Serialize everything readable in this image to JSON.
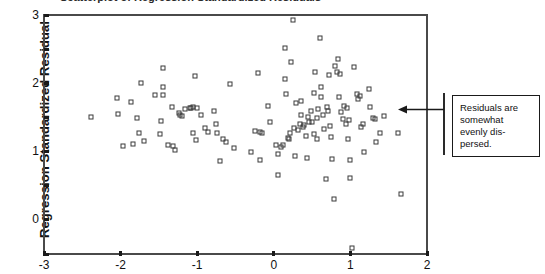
{
  "chart_data": {
    "type": "scatter",
    "title": "Scatterplot of Regression Standardized Residuals",
    "xlabel": "",
    "ylabel": "Regression Standardized Residual",
    "xlim": [
      -3,
      2
    ],
    "ylim": [
      -4,
      3
    ],
    "xticks": [
      -3,
      -2,
      -1,
      0,
      1,
      2
    ],
    "xticklabels": [
      "-3",
      "-2",
      "-1",
      "0",
      "1",
      "2"
    ],
    "yticks": [
      3,
      2,
      1,
      0,
      -1,
      -2,
      -3,
      -4
    ],
    "yticklabels": [
      "3",
      "2",
      "1",
      "0",
      "-1",
      "-2",
      "-3",
      "-4"
    ],
    "grid": false,
    "legend": null,
    "marker": "open-square",
    "marker_color": "#3a3a3a",
    "points": [
      [
        -2.38,
        0.02
      ],
      [
        -2.03,
        0.11
      ],
      [
        -2.05,
        0.57
      ],
      [
        -1.97,
        -0.85
      ],
      [
        -1.86,
        0.44
      ],
      [
        -1.84,
        -0.79
      ],
      [
        -1.74,
        1.0
      ],
      [
        -1.78,
        -0.02
      ],
      [
        -1.76,
        -0.46
      ],
      [
        -1.7,
        -0.7
      ],
      [
        -1.55,
        0.66
      ],
      [
        -1.45,
        1.45
      ],
      [
        -1.44,
        0.89
      ],
      [
        -1.45,
        0.66
      ],
      [
        -1.47,
        -0.1
      ],
      [
        -1.48,
        -0.49
      ],
      [
        -1.38,
        -0.81
      ],
      [
        -1.33,
        0.32
      ],
      [
        -1.31,
        -0.83
      ],
      [
        -1.29,
        -0.95
      ],
      [
        -1.24,
        0.12
      ],
      [
        -1.22,
        0.08
      ],
      [
        -1.2,
        0.04
      ],
      [
        -1.16,
        0.24
      ],
      [
        -1.1,
        0.27
      ],
      [
        -1.08,
        0.29
      ],
      [
        -1.03,
        1.22
      ],
      [
        -1.05,
        0.3
      ],
      [
        -1.05,
        -0.45
      ],
      [
        -1.0,
        0.28
      ],
      [
        -1.02,
        -0.65
      ],
      [
        -0.95,
        0.06
      ],
      [
        -0.9,
        -0.3
      ],
      [
        -0.86,
        -0.42
      ],
      [
        -0.78,
        0.19
      ],
      [
        -0.76,
        -0.2
      ],
      [
        -0.74,
        -0.45
      ],
      [
        -0.7,
        -1.29
      ],
      [
        -0.66,
        -0.62
      ],
      [
        -0.62,
        -0.73
      ],
      [
        -0.57,
        0.97
      ],
      [
        -0.52,
        -0.9
      ],
      [
        -0.3,
        -1.02
      ],
      [
        -0.24,
        -0.41
      ],
      [
        -0.21,
        1.31
      ],
      [
        -0.18,
        -0.44
      ],
      [
        -0.16,
        -0.46
      ],
      [
        -0.18,
        -1.24
      ],
      [
        -0.07,
        0.33
      ],
      [
        -0.05,
        -0.12
      ],
      [
        0.03,
        -0.8
      ],
      [
        0.05,
        -1.08
      ],
      [
        0.06,
        -1.69
      ],
      [
        0.09,
        -0.86
      ],
      [
        0.12,
        -0.82
      ],
      [
        0.15,
        2.03
      ],
      [
        0.14,
        1.12
      ],
      [
        0.16,
        0.7
      ],
      [
        0.18,
        -0.59
      ],
      [
        0.2,
        -0.64
      ],
      [
        0.21,
        -0.46
      ],
      [
        0.23,
        1.61
      ],
      [
        0.25,
        2.84
      ],
      [
        0.26,
        -0.3
      ],
      [
        0.28,
        -1.12
      ],
      [
        0.29,
        0.42
      ],
      [
        0.32,
        -0.38
      ],
      [
        0.34,
        -0.19
      ],
      [
        0.36,
        0.06
      ],
      [
        0.38,
        -0.28
      ],
      [
        0.35,
        0.47
      ],
      [
        0.4,
        -0.22
      ],
      [
        0.42,
        -0.55
      ],
      [
        0.44,
        0.0
      ],
      [
        0.43,
        -1.2
      ],
      [
        0.46,
        -0.14
      ],
      [
        0.48,
        0.18
      ],
      [
        0.5,
        -0.12
      ],
      [
        0.52,
        -0.48
      ],
      [
        0.54,
        1.33
      ],
      [
        0.53,
        0.71
      ],
      [
        0.56,
        -0.02
      ],
      [
        0.58,
        0.26
      ],
      [
        0.57,
        -0.62
      ],
      [
        0.6,
        2.32
      ],
      [
        0.61,
        0.9
      ],
      [
        0.62,
        0.59
      ],
      [
        0.64,
        0.08
      ],
      [
        0.66,
        -0.33
      ],
      [
        0.68,
        -1.79
      ],
      [
        0.7,
        0.3
      ],
      [
        0.72,
        1.25
      ],
      [
        0.71,
        0.18
      ],
      [
        0.74,
        -0.25
      ],
      [
        0.75,
        -0.58
      ],
      [
        0.76,
        -1.22
      ],
      [
        0.78,
        -2.39
      ],
      [
        0.8,
        1.51
      ],
      [
        0.82,
        1.33
      ],
      [
        0.84,
        1.7
      ],
      [
        0.86,
        1.26
      ],
      [
        0.85,
        0.61
      ],
      [
        0.88,
        0.17
      ],
      [
        0.9,
        -0.06
      ],
      [
        0.92,
        0.34
      ],
      [
        0.94,
        -0.2
      ],
      [
        0.96,
        0.28
      ],
      [
        0.98,
        -0.08
      ],
      [
        0.97,
        -0.63
      ],
      [
        0.99,
        -1.24
      ],
      [
        1.0,
        -1.77
      ],
      [
        1.02,
        -3.83
      ],
      [
        1.05,
        1.48
      ],
      [
        1.08,
        0.7
      ],
      [
        1.1,
        0.55
      ],
      [
        1.12,
        0.64
      ],
      [
        1.14,
        -0.27
      ],
      [
        1.16,
        -0.2
      ],
      [
        1.18,
        -1.02
      ],
      [
        1.24,
        0.83
      ],
      [
        1.26,
        0.3
      ],
      [
        1.3,
        -0.01
      ],
      [
        1.32,
        -0.05
      ],
      [
        1.34,
        -0.71
      ],
      [
        1.38,
        -0.47
      ],
      [
        1.44,
        0.03
      ],
      [
        1.62,
        -0.46
      ],
      [
        1.66,
        -2.25
      ]
    ]
  },
  "annotation": {
    "text": "Residuals are somewhat evenly dis-persed.",
    "arrow_icon": "left-arrow-icon"
  },
  "colors": {
    "marker": "#3a3a3a",
    "axis": "#4a4a4a",
    "text": "#111111",
    "background": "#ffffff"
  }
}
